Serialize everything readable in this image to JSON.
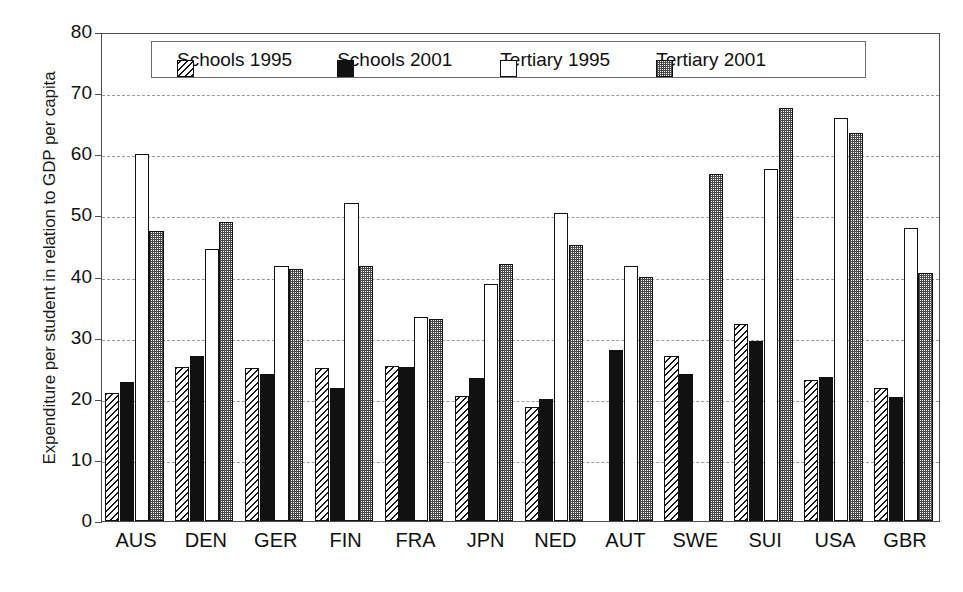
{
  "chart_data": {
    "type": "bar",
    "title": "",
    "xlabel": "",
    "ylabel": "Expenditure per student in relation to GDP per capita",
    "ylim": [
      0,
      80
    ],
    "ytick_step": 10,
    "yticks": [
      0,
      10,
      20,
      30,
      40,
      50,
      60,
      70,
      80
    ],
    "grid": "horizontal-dashed",
    "legend_position": "top-center-inside",
    "categories": [
      "AUS",
      "DEN",
      "GER",
      "FIN",
      "FRA",
      "JPN",
      "NED",
      "AUT",
      "SWE",
      "SUI",
      "USA",
      "GBR"
    ],
    "series": [
      {
        "name": "Schools 1995",
        "pattern": "diagonal-hatch",
        "values": [
          21.0,
          25.2,
          25.0,
          25.0,
          25.3,
          20.4,
          18.7,
          null,
          27.0,
          32.2,
          23.0,
          21.7
        ]
      },
      {
        "name": "Schools 2001",
        "pattern": "solid-black",
        "values": [
          22.7,
          27.0,
          24.0,
          21.8,
          25.2,
          23.4,
          20.0,
          28.0,
          24.0,
          29.5,
          23.5,
          20.3
        ]
      },
      {
        "name": "Tertiary 1995",
        "pattern": "white-empty",
        "values": [
          60.1,
          44.5,
          41.8,
          52.0,
          33.3,
          38.7,
          50.4,
          41.8,
          null,
          57.6,
          66.0,
          48.0
        ]
      },
      {
        "name": "Tertiary 2001",
        "pattern": "gray-stipple",
        "values": [
          47.5,
          49.0,
          41.3,
          41.8,
          33.1,
          42.0,
          45.2,
          40.0,
          56.7,
          67.6,
          63.4,
          40.6
        ]
      }
    ]
  },
  "axes": {
    "ylabel": "Expenditure per student in relation to GDP per capita",
    "ytick_labels": [
      "0",
      "10",
      "20",
      "30",
      "40",
      "50",
      "60",
      "70",
      "80"
    ],
    "xtick_labels": [
      "AUS",
      "DEN",
      "GER",
      "FIN",
      "FRA",
      "JPN",
      "NED",
      "AUT",
      "SWE",
      "SUI",
      "USA",
      "GBR"
    ]
  },
  "legend": {
    "items": [
      {
        "label": "Schools 1995",
        "swatch": "hatched-swatch-icon"
      },
      {
        "label": "Schools 2001",
        "swatch": "black-swatch-icon"
      },
      {
        "label": "Tertiary 1995",
        "swatch": "white-swatch-icon"
      },
      {
        "label": "Tertiary 2001",
        "swatch": "gray-swatch-icon"
      }
    ]
  },
  "colors": {
    "axis": "#4d4d4d",
    "grid": "#9a9a9a",
    "bar_outline": "#111111",
    "schools2001_fill": "#111111",
    "tertiary2001_fill": "#9a9a9a",
    "background": "#ffffff"
  }
}
